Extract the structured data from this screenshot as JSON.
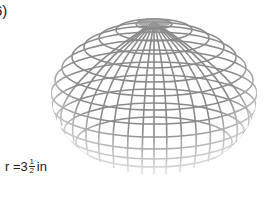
{
  "problem": {
    "number_label": "6)"
  },
  "figure": {
    "shape": "sphere-wireframe",
    "line_color": "#8a8a8a"
  },
  "radius": {
    "prefix": "r = ",
    "whole": "3",
    "numerator": "1",
    "denominator": "2",
    "unit": "in"
  }
}
